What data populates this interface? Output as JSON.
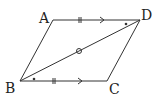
{
  "figure": {
    "type": "geometry",
    "shape": "parallelogram",
    "labels": {
      "A": "A",
      "B": "B",
      "C": "C",
      "D": "D"
    },
    "points": {
      "A": [
        53,
        20
      ],
      "B": [
        20,
        81
      ],
      "C": [
        107,
        81
      ],
      "D": [
        140,
        20
      ]
    },
    "segments": [
      "AB",
      "BC",
      "CD",
      "DA",
      "BD"
    ],
    "marks": {
      "equal_length_ticks": [
        "AD",
        "BC"
      ],
      "parallel_arrows": [
        "AD",
        "BC"
      ],
      "equal_angle_dots": [
        "angle ADB",
        "angle CBD"
      ],
      "midpoint_circle": "BD"
    },
    "line_color": "#333333"
  }
}
